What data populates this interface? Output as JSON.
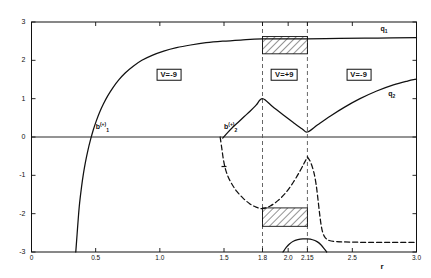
{
  "chart_data": {
    "type": "line",
    "title": "",
    "xlabel": "r",
    "ylabel": "",
    "xlim": [
      0,
      3.0
    ],
    "ylim": [
      -3,
      3
    ],
    "grid": false,
    "legend_position": "inline-curve-labels",
    "x_ticks": [
      {
        "value": 0,
        "label": "0"
      },
      {
        "value": 0.5,
        "label": "0.5"
      },
      {
        "value": 1.0,
        "label": "1.0"
      },
      {
        "value": 1.5,
        "label": "1.5"
      },
      {
        "value": 1.8,
        "label": "1.8"
      },
      {
        "value": 2.0,
        "label": "2.0"
      },
      {
        "value": 2.15,
        "label": "2.15"
      },
      {
        "value": 2.5,
        "label": "2.5"
      },
      {
        "value": 3.0,
        "label": "3.0"
      }
    ],
    "y_ticks": [
      {
        "value": 3,
        "label": "3"
      },
      {
        "value": 2,
        "label": "2"
      },
      {
        "value": 1,
        "label": "1"
      },
      {
        "value": 0,
        "label": "0"
      },
      {
        "value": -1,
        "label": "-1"
      },
      {
        "value": -2,
        "label": "-2"
      },
      {
        "value": -3,
        "label": "-3"
      }
    ],
    "vertical_markers": [
      {
        "value": 1.8,
        "style": "dashed"
      },
      {
        "value": 2.15,
        "style": "dashed"
      }
    ],
    "region_labels": [
      {
        "text": "V=-9",
        "x": 1.07,
        "y": 1.62
      },
      {
        "text": "V=+9",
        "x": 1.97,
        "y": 1.62
      },
      {
        "text": "V=-9",
        "x": 2.55,
        "y": 1.62
      }
    ],
    "curve_labels": [
      {
        "text": "q",
        "sub": "1",
        "sup": "",
        "x": 2.72,
        "y": 2.78
      },
      {
        "text": "q",
        "sub": "2",
        "sup": "",
        "x": 2.78,
        "y": 1.09
      },
      {
        "text": "b",
        "sub": "1",
        "sup": "(+)",
        "x": 0.5,
        "y": 0.26
      },
      {
        "text": "b",
        "sub": "2",
        "sup": "(+)",
        "x": 1.5,
        "y": 0.26
      }
    ],
    "hatched_regions": [
      {
        "name": "upper-band",
        "x0": 1.8,
        "x1": 2.15,
        "y0": 2.17,
        "y1": 2.62
      },
      {
        "name": "lower-band",
        "x0": 1.8,
        "x1": 2.15,
        "y0": -2.33,
        "y1": -1.85
      }
    ],
    "series": [
      {
        "name": "q1",
        "style": "solid",
        "points": [
          [
            0.345,
            -3.0
          ],
          [
            0.355,
            -2.55
          ],
          [
            0.365,
            -2.1
          ],
          [
            0.375,
            -1.72
          ],
          [
            0.39,
            -1.3
          ],
          [
            0.405,
            -0.95
          ],
          [
            0.42,
            -0.66
          ],
          [
            0.44,
            -0.34
          ],
          [
            0.46,
            -0.07
          ],
          [
            0.48,
            0.17
          ],
          [
            0.505,
            0.42
          ],
          [
            0.53,
            0.64
          ],
          [
            0.56,
            0.86
          ],
          [
            0.595,
            1.08
          ],
          [
            0.635,
            1.29
          ],
          [
            0.68,
            1.49
          ],
          [
            0.73,
            1.67
          ],
          [
            0.79,
            1.84
          ],
          [
            0.86,
            2.0
          ],
          [
            0.94,
            2.13
          ],
          [
            1.03,
            2.24
          ],
          [
            1.13,
            2.33
          ],
          [
            1.24,
            2.4
          ],
          [
            1.36,
            2.46
          ],
          [
            1.49,
            2.5
          ],
          [
            1.63,
            2.53
          ],
          [
            1.8,
            2.56
          ],
          [
            2.15,
            2.56
          ],
          [
            2.4,
            2.57
          ],
          [
            2.7,
            2.58
          ],
          [
            3.0,
            2.59
          ]
        ]
      },
      {
        "name": "q2",
        "style": "solid",
        "points": [
          [
            1.49,
            -0.03
          ],
          [
            1.53,
            0.12
          ],
          [
            1.57,
            0.26
          ],
          [
            1.615,
            0.4
          ],
          [
            1.66,
            0.54
          ],
          [
            1.705,
            0.68
          ],
          [
            1.75,
            0.83
          ],
          [
            1.8,
            1.0
          ],
          [
            1.88,
            0.79
          ],
          [
            1.96,
            0.58
          ],
          [
            2.04,
            0.38
          ],
          [
            2.11,
            0.21
          ],
          [
            2.15,
            0.13
          ],
          [
            2.23,
            0.32
          ],
          [
            2.33,
            0.55
          ],
          [
            2.44,
            0.78
          ],
          [
            2.56,
            1.0
          ],
          [
            2.69,
            1.2
          ],
          [
            2.82,
            1.36
          ],
          [
            2.93,
            1.46
          ],
          [
            3.0,
            1.51
          ]
        ]
      },
      {
        "name": "branch-left-dashed",
        "style": "dashed",
        "points": [
          [
            1.47,
            0.0
          ],
          [
            1.483,
            -0.3
          ],
          [
            1.495,
            -0.58
          ],
          [
            1.51,
            -0.82
          ],
          [
            1.53,
            -1.02
          ],
          [
            1.56,
            -1.22
          ],
          [
            1.6,
            -1.42
          ],
          [
            1.65,
            -1.6
          ],
          [
            1.7,
            -1.74
          ],
          [
            1.75,
            -1.83
          ],
          [
            1.8,
            -1.87
          ],
          [
            1.86,
            -1.8
          ],
          [
            1.92,
            -1.66
          ],
          [
            1.98,
            -1.46
          ],
          [
            2.04,
            -1.18
          ],
          [
            2.09,
            -0.9
          ],
          [
            2.125,
            -0.68
          ],
          [
            2.15,
            -0.52
          ]
        ]
      },
      {
        "name": "branch-right-dashed",
        "style": "dashed",
        "points": [
          [
            2.15,
            -0.52
          ],
          [
            2.175,
            -0.66
          ],
          [
            2.2,
            -0.92
          ],
          [
            2.218,
            -1.24
          ],
          [
            2.232,
            -1.62
          ],
          [
            2.245,
            -2.0
          ],
          [
            2.258,
            -2.32
          ],
          [
            2.272,
            -2.52
          ],
          [
            2.29,
            -2.63
          ],
          [
            2.32,
            -2.7
          ],
          [
            2.38,
            -2.73
          ],
          [
            2.48,
            -2.74
          ],
          [
            2.62,
            -2.75
          ],
          [
            2.8,
            -2.75
          ],
          [
            3.0,
            -2.75
          ]
        ]
      },
      {
        "name": "lower-arc",
        "style": "solid",
        "points": [
          [
            1.96,
            -3.0
          ],
          [
            1.985,
            -2.88
          ],
          [
            2.01,
            -2.79
          ],
          [
            2.04,
            -2.72
          ],
          [
            2.075,
            -2.68
          ],
          [
            2.115,
            -2.66
          ],
          [
            2.15,
            -2.66
          ],
          [
            2.19,
            -2.68
          ],
          [
            2.225,
            -2.73
          ],
          [
            2.255,
            -2.81
          ],
          [
            2.28,
            -2.91
          ],
          [
            2.3,
            -3.0
          ]
        ]
      }
    ],
    "tick_markers": [
      {
        "name": "left-branch-tick",
        "x": 1.5,
        "y": -0.77
      }
    ]
  }
}
